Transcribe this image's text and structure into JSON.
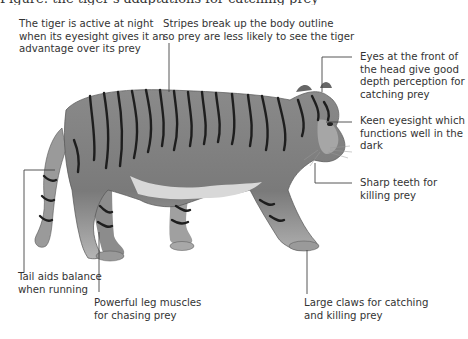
{
  "figure": {
    "title_partial": "Figure: the tiger's adaptations for catching prey",
    "annotations": [
      {
        "id": "night",
        "text": "The tiger is active at night\nwhen its eyesight gives it an\nadvantage over its prey"
      },
      {
        "id": "stripes",
        "text": "Stripes break up the body outline\nso prey are less likely to see the tiger"
      },
      {
        "id": "eyes",
        "text": "Eyes at the front of\nthe head give good\ndepth perception for\ncatching prey"
      },
      {
        "id": "keen",
        "text": "Keen eyesight which\nfunctions well in the\ndark"
      },
      {
        "id": "teeth",
        "text": "Sharp teeth for\nkilling prey"
      },
      {
        "id": "tail",
        "text": "Tail aids balance\nwhen running"
      },
      {
        "id": "legs",
        "text": "Powerful leg muscles\nfor chasing prey"
      },
      {
        "id": "claws",
        "text": "Large claws for catching\nand killing prey"
      }
    ]
  }
}
